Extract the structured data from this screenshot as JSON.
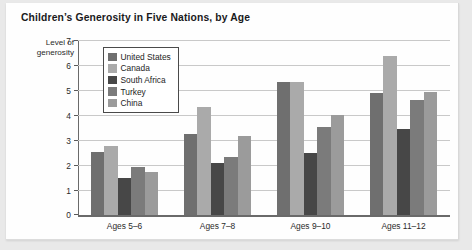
{
  "chart_data": {
    "type": "bar",
    "title": "Children’s Generosity in Five Nations, by Age",
    "xlabel": "",
    "ylabel": "Level of generosity",
    "ylabel_lines": [
      "Level of",
      "generosity"
    ],
    "categories": [
      "Ages 5–6",
      "Ages 7–8",
      "Ages 9–10",
      "Ages 11–12"
    ],
    "ylim": [
      0,
      7
    ],
    "yticks": [
      0,
      1,
      2,
      3,
      4,
      5,
      6,
      7
    ],
    "ytick_labels": [
      "0",
      "1",
      "2",
      "3",
      "4",
      "5",
      "6",
      "7"
    ],
    "grid": true,
    "grid_axis": "y",
    "legend_position": "upper-left-inside",
    "series": [
      {
        "name": "United States",
        "color": "#6f6f6f",
        "values": [
          2.55,
          3.25,
          5.35,
          4.9
        ]
      },
      {
        "name": "Canada",
        "color": "#aaaaaa",
        "values": [
          2.8,
          4.35,
          5.35,
          6.4
        ]
      },
      {
        "name": "South Africa",
        "color": "#474747",
        "values": [
          1.5,
          2.1,
          2.5,
          3.45
        ]
      },
      {
        "name": "Turkey",
        "color": "#7b7b7b",
        "values": [
          1.95,
          2.35,
          3.55,
          4.65
        ]
      },
      {
        "name": "China",
        "color": "#9b9b9b",
        "values": [
          1.75,
          3.2,
          4.05,
          4.95
        ]
      }
    ]
  },
  "colors": {
    "card_background": "#fefefe",
    "page_background": "#e9e9e9",
    "axis": "#6a6a6a",
    "gridline": "#c9c9c9",
    "text": "#1d1d1d"
  }
}
